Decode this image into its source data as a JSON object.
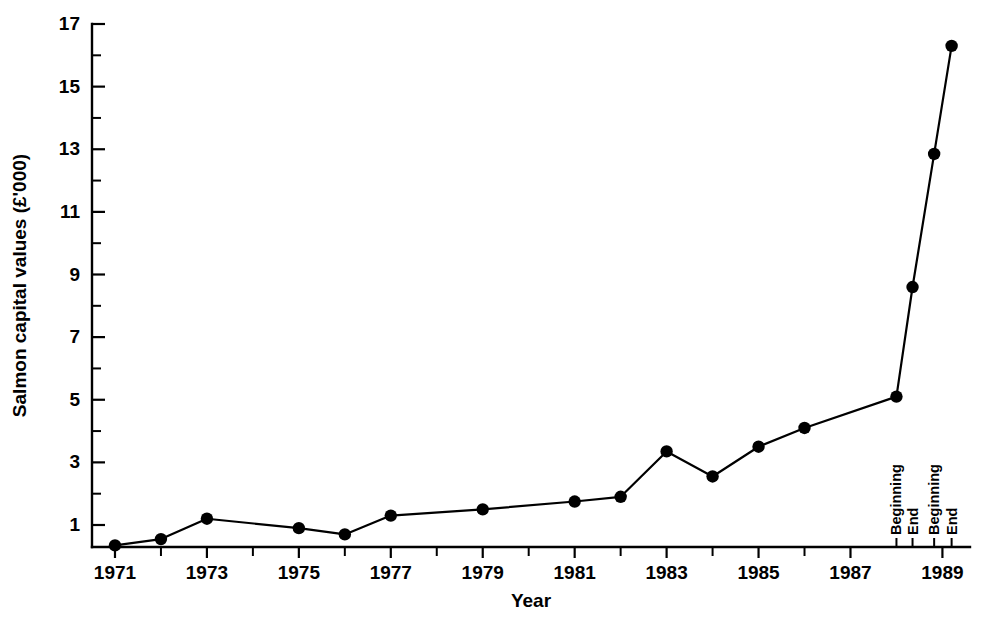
{
  "chart_data": {
    "type": "line",
    "title": "",
    "xlabel": "Year",
    "ylabel": "Salmon capital values (£'000)",
    "xlim": [
      1970.5,
      1989.6
    ],
    "ylim": [
      0,
      17
    ],
    "grid": false,
    "legend": "none",
    "y_tick_labels": [
      "17",
      "15",
      "13",
      "11",
      "9",
      "7",
      "5",
      "3",
      "1"
    ],
    "y_tick_values": [
      17,
      15,
      13,
      11,
      9,
      7,
      5,
      3,
      1
    ],
    "y_minor_tick_values": [
      16,
      14,
      12,
      10,
      8,
      6,
      4,
      2
    ],
    "x_tick_labels": [
      "1971",
      "1973",
      "1975",
      "1977",
      "1979",
      "1981",
      "1983",
      "1985",
      "1987",
      "1989"
    ],
    "x_tick_values": [
      1971,
      1973,
      1975,
      1977,
      1979,
      1981,
      1983,
      1985,
      1987,
      1989
    ],
    "x_minor_tick_values": [
      1972,
      1974,
      1976,
      1978,
      1980,
      1982,
      1984,
      1986
    ],
    "phase_ticks": [
      {
        "label": "Beginning",
        "x": 1988.0
      },
      {
        "label": "End",
        "x": 1988.35
      },
      {
        "label": "Beginning",
        "x": 1988.82
      },
      {
        "label": "End",
        "x": 1989.2
      }
    ],
    "series": [
      {
        "name": "Salmon capital values",
        "color": "#000000",
        "points": [
          {
            "x": 1971.0,
            "label": "1971",
            "y": 0.35
          },
          {
            "x": 1972.0,
            "label": "1972",
            "y": 0.55
          },
          {
            "x": 1973.0,
            "label": "1973",
            "y": 1.2
          },
          {
            "x": 1975.0,
            "label": "1975",
            "y": 0.9
          },
          {
            "x": 1976.0,
            "label": "1976",
            "y": 0.7
          },
          {
            "x": 1977.0,
            "label": "1977",
            "y": 1.3
          },
          {
            "x": 1979.0,
            "label": "1979",
            "y": 1.5
          },
          {
            "x": 1981.0,
            "label": "1981",
            "y": 1.75
          },
          {
            "x": 1982.0,
            "label": "1982",
            "y": 1.9
          },
          {
            "x": 1983.0,
            "label": "1983",
            "y": 3.35
          },
          {
            "x": 1984.0,
            "label": "1984",
            "y": 2.55
          },
          {
            "x": 1985.0,
            "label": "1985",
            "y": 3.5
          },
          {
            "x": 1986.0,
            "label": "1986",
            "y": 4.1
          },
          {
            "x": 1988.0,
            "label": "1988 Beginning",
            "y": 5.1
          },
          {
            "x": 1988.35,
            "label": "1988 End",
            "y": 8.6
          },
          {
            "x": 1988.82,
            "label": "1989 Beginning",
            "y": 12.85
          },
          {
            "x": 1989.2,
            "label": "1989 End",
            "y": 16.3
          }
        ]
      }
    ]
  }
}
